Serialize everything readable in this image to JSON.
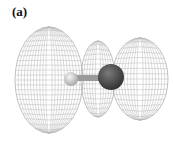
{
  "figure": {
    "panel_label": "(a)",
    "colors": {
      "wireframe": "#b5b5b5",
      "small_atom": "#d8d8d8",
      "large_atom": "#4a4a4a",
      "bond": "#9a9a9a"
    },
    "lobes": [
      {
        "name": "left",
        "cx": 49,
        "cy": 80,
        "rx": 34,
        "ry": 53
      },
      {
        "name": "middle",
        "cx": 98,
        "cy": 79,
        "rx": 17,
        "ry": 38
      },
      {
        "name": "right",
        "cx": 140,
        "cy": 79,
        "rx": 28,
        "ry": 41
      }
    ],
    "atoms": [
      {
        "name": "small-atom",
        "cx": 71,
        "cy": 79,
        "r": 7
      },
      {
        "name": "large-atom",
        "cx": 111,
        "cy": 77,
        "r": 13
      }
    ]
  }
}
